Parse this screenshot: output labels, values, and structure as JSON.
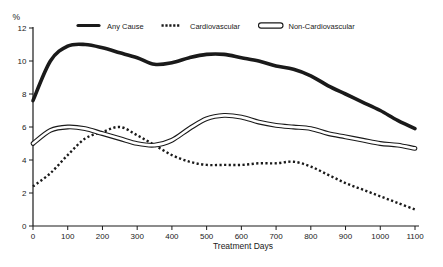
{
  "colors": {
    "ink": "#1a1a1a",
    "background": "#ffffff"
  },
  "legend": [
    {
      "label": "Any Cause",
      "style": "solid-thick"
    },
    {
      "label": "Cardiovascular",
      "style": "dotted"
    },
    {
      "label": "Non-Cardiovascular",
      "style": "outlined-capsule"
    }
  ],
  "chart_data": {
    "type": "line",
    "title": "",
    "xlabel": "Treatment Days",
    "ylabel": "%",
    "xlim": [
      0,
      1100
    ],
    "ylim": [
      0,
      12
    ],
    "x_ticks": [
      0,
      100,
      200,
      300,
      400,
      500,
      600,
      700,
      800,
      900,
      1000,
      1100
    ],
    "y_ticks": [
      0,
      2,
      4,
      6,
      8,
      10,
      12
    ],
    "grid": false,
    "legend_position": "top",
    "x": [
      0,
      50,
      100,
      150,
      200,
      250,
      300,
      350,
      400,
      450,
      500,
      550,
      600,
      650,
      700,
      750,
      800,
      850,
      900,
      950,
      1000,
      1050,
      1100
    ],
    "series": [
      {
        "name": "Any Cause",
        "style": "solid-thick",
        "values": [
          7.6,
          10.0,
          10.9,
          11.0,
          10.8,
          10.5,
          10.2,
          9.8,
          9.9,
          10.2,
          10.4,
          10.4,
          10.2,
          10.0,
          9.7,
          9.5,
          9.1,
          8.5,
          8.0,
          7.5,
          7.0,
          6.4,
          5.9
        ]
      },
      {
        "name": "Cardiovascular",
        "style": "dotted",
        "values": [
          2.4,
          3.2,
          4.3,
          5.3,
          5.7,
          6.0,
          5.5,
          4.9,
          4.3,
          3.9,
          3.7,
          3.7,
          3.7,
          3.8,
          3.8,
          3.9,
          3.6,
          3.1,
          2.6,
          2.2,
          1.8,
          1.4,
          1.0
        ]
      },
      {
        "name": "Non-Cardiovascular",
        "style": "outlined-capsule",
        "values": [
          5.0,
          5.8,
          6.0,
          5.9,
          5.6,
          5.3,
          5.0,
          4.9,
          5.2,
          5.9,
          6.5,
          6.7,
          6.6,
          6.3,
          6.1,
          6.0,
          5.9,
          5.6,
          5.4,
          5.2,
          5.0,
          4.9,
          4.7
        ]
      }
    ]
  }
}
